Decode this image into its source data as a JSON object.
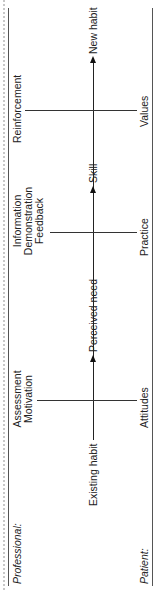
{
  "diagram": {
    "row_labels": {
      "professional": "Professional:",
      "patient": "Patient:"
    },
    "axis": {
      "start": "Existing habit",
      "stages": [
        "Perceived need",
        "Skill",
        "New habit"
      ]
    },
    "professional_inputs": [
      {
        "lines": [
          "Assessment",
          "Motivation"
        ]
      },
      {
        "lines": [
          "Information",
          "Demonstration",
          "Feedback"
        ]
      },
      {
        "lines": [
          "Reinforcement"
        ]
      }
    ],
    "patient_inputs": [
      "Attitudes",
      "Practice",
      "Values"
    ],
    "colors": {
      "line": "#333333",
      "text": "#222222"
    }
  }
}
